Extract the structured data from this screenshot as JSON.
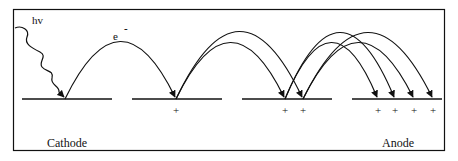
{
  "diagram": {
    "labels": {
      "photon": "hv",
      "electron": "e",
      "electron_charge": "-",
      "cathode": "Cathode",
      "anode": "Anode"
    },
    "ion_symbol": "+",
    "plates": [
      {
        "name": "cathode",
        "x1": 22,
        "x2": 112
      },
      {
        "name": "dynode-1",
        "x1": 132,
        "x2": 222
      },
      {
        "name": "dynode-2",
        "x1": 242,
        "x2": 332
      },
      {
        "name": "anode",
        "x1": 352,
        "x2": 442
      }
    ],
    "plate_y": 99,
    "ion_marks_x": [
      176,
      285,
      303,
      378,
      395,
      414,
      433
    ],
    "electron_paths": [
      {
        "from": 65,
        "to": 176,
        "peak": 42
      },
      {
        "from": 176,
        "to": 285,
        "peak": 43
      },
      {
        "from": 176,
        "to": 303,
        "peak": 32
      },
      {
        "from": 285,
        "to": 378,
        "peak": 43
      },
      {
        "from": 285,
        "to": 395,
        "peak": 33
      },
      {
        "from": 303,
        "to": 414,
        "peak": 43
      },
      {
        "from": 303,
        "to": 433,
        "peak": 33
      }
    ],
    "colors": {
      "ink": "#111111",
      "background": "#ffffff"
    }
  }
}
